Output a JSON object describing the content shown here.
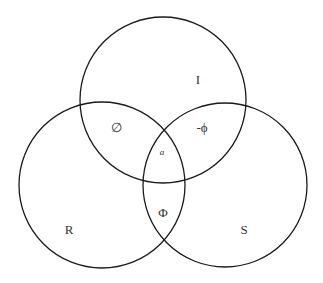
{
  "diagram": {
    "type": "venn",
    "stroke_color": "#1a1a1a",
    "circles": [
      {
        "id": "I",
        "label": "I",
        "cx": 163,
        "cy": 100,
        "r": 83
      },
      {
        "id": "R",
        "label": "R",
        "cx": 102,
        "cy": 185,
        "r": 83
      },
      {
        "id": "S",
        "label": "S",
        "cx": 225,
        "cy": 185,
        "r": 82
      }
    ],
    "labels": {
      "I": {
        "text": "I",
        "x": 198,
        "y": 79
      },
      "R": {
        "text": "R",
        "x": 69,
        "y": 229
      },
      "S": {
        "text": "S",
        "x": 244,
        "y": 229
      },
      "I_R": {
        "text": "∅",
        "x": 116,
        "y": 127
      },
      "I_S": {
        "text": "-ϕ",
        "x": 202,
        "y": 127
      },
      "center": {
        "text": "a",
        "x": 162,
        "y": 152
      },
      "R_S": {
        "text": "Φ",
        "x": 163,
        "y": 212
      }
    }
  }
}
